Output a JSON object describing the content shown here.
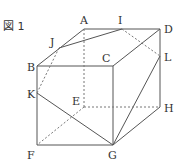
{
  "figure": {
    "label": "図 1",
    "type": "cube-cross-section",
    "vertices": {
      "A": {
        "label": "A",
        "x": 84,
        "y": 29
      },
      "B": {
        "label": "B",
        "x": 37,
        "y": 66
      },
      "C": {
        "label": "C",
        "x": 113,
        "y": 66
      },
      "D": {
        "label": "D",
        "x": 160,
        "y": 29
      },
      "E": {
        "label": "E",
        "x": 84,
        "y": 107
      },
      "F": {
        "label": "F",
        "x": 37,
        "y": 145
      },
      "G": {
        "label": "G",
        "x": 113,
        "y": 145
      },
      "H": {
        "label": "H",
        "x": 160,
        "y": 107
      },
      "I": {
        "label": "I",
        "x": 122,
        "y": 29
      },
      "J": {
        "label": "J",
        "x": 59,
        "y": 48
      },
      "K": {
        "label": "K",
        "x": 37,
        "y": 93
      },
      "L": {
        "label": "L",
        "x": 160,
        "y": 56
      }
    },
    "solid_edges": [
      [
        "A",
        "D"
      ],
      [
        "A",
        "B"
      ],
      [
        "B",
        "C"
      ],
      [
        "C",
        "D"
      ],
      [
        "B",
        "F"
      ],
      [
        "F",
        "G"
      ],
      [
        "C",
        "G"
      ],
      [
        "D",
        "H"
      ],
      [
        "G",
        "H"
      ],
      [
        "J",
        "I"
      ],
      [
        "K",
        "G"
      ],
      [
        "L",
        "G"
      ],
      [
        "C",
        "D"
      ]
    ],
    "dashed_edges": [
      [
        "A",
        "E"
      ],
      [
        "E",
        "F"
      ],
      [
        "E",
        "H"
      ],
      [
        "J",
        "K"
      ],
      [
        "I",
        "L"
      ]
    ]
  }
}
